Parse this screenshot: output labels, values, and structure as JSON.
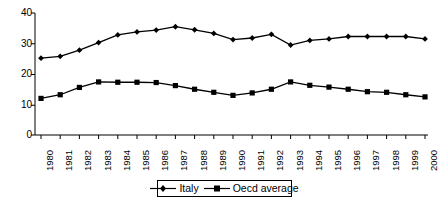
{
  "chart_data": {
    "type": "line",
    "title": "",
    "subtitle": "",
    "xlabel": "",
    "ylabel": "",
    "categories": [
      "1980",
      "1981",
      "1982",
      "1983",
      "1984",
      "1985",
      "1986",
      "1987",
      "1988",
      "1989",
      "1990",
      "1991",
      "1992",
      "1993",
      "1994",
      "1995",
      "1996",
      "1997",
      "1998",
      "1999",
      "2000"
    ],
    "series": [
      {
        "name": "Italy",
        "marker": "diamond",
        "color": "#000000",
        "values": [
          25.2,
          25.8,
          27.8,
          30.3,
          32.8,
          33.8,
          34.4,
          35.5,
          34.5,
          33.3,
          31.3,
          31.8,
          33.0,
          29.5,
          31.0,
          31.5,
          32.3,
          32.3,
          32.3,
          32.3,
          31.5
        ]
      },
      {
        "name": "Oecd average",
        "marker": "square",
        "color": "#000000",
        "values": [
          12.0,
          13.2,
          15.6,
          17.4,
          17.3,
          17.3,
          17.2,
          16.2,
          15.0,
          14.0,
          13.0,
          13.8,
          15.0,
          17.4,
          16.3,
          15.7,
          15.0,
          14.2,
          14.0,
          13.2,
          12.5
        ]
      }
    ],
    "ylim": [
      0,
      40
    ],
    "yticks": [
      0,
      10,
      20,
      30,
      40
    ],
    "ytick_labels": [
      "0",
      "10",
      "20",
      "30",
      "40"
    ],
    "grid": false,
    "legend_position": "bottom"
  },
  "axes": {
    "y_labels": [
      "40",
      "30",
      "20",
      "10",
      "0"
    ],
    "x_labels": [
      "1980",
      "1981",
      "1982",
      "1983",
      "1984",
      "1985",
      "1986",
      "1987",
      "1988",
      "1989",
      "1990",
      "1991",
      "1992",
      "1993",
      "1994",
      "1995",
      "1996",
      "1997",
      "1998",
      "1999",
      "2000"
    ]
  },
  "legend": {
    "items": [
      {
        "label": "Italy",
        "marker": "diamond-marker"
      },
      {
        "label": "Oecd average",
        "marker": "square-marker"
      }
    ]
  }
}
